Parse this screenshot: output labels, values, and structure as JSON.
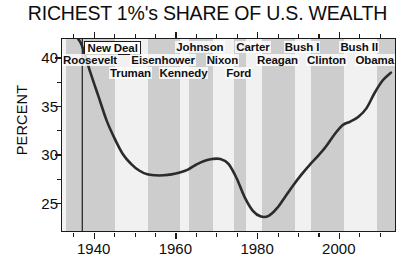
{
  "chart_data": {
    "type": "line",
    "title": "RICHEST 1%'s SHARE OF U.S. WEALTH",
    "xlabel": "",
    "ylabel": "PERCENT",
    "xlim": [
      1932,
      2014
    ],
    "ylim": [
      22.0,
      42.0
    ],
    "grid": false,
    "legend": "none",
    "x_ticks": [
      1940,
      1960,
      1980,
      2000
    ],
    "x_tick_labels": [
      "1940",
      "1960",
      "1980",
      "2000"
    ],
    "x_minor_tick_step": 5,
    "y_ticks": [
      25,
      30,
      35,
      40
    ],
    "y_tick_labels": [
      "25",
      "30",
      "35",
      "40"
    ],
    "series": [
      {
        "name": "Richest 1% share of U.S. wealth",
        "color": "#2b2b2b",
        "x": [
          1932,
          1934,
          1936,
          1937,
          1939,
          1941,
          1943,
          1945,
          1947,
          1949,
          1951,
          1953,
          1955,
          1957,
          1959,
          1961,
          1963,
          1965,
          1967,
          1969,
          1971,
          1973,
          1975,
          1977,
          1979,
          1981,
          1983,
          1985,
          1987,
          1989,
          1991,
          1993,
          1995,
          1997,
          1999,
          2001,
          2003,
          2005,
          2007,
          2009,
          2011,
          2013
        ],
        "y": [
          44.0,
          43.2,
          42.0,
          41.2,
          38.5,
          36.0,
          33.5,
          31.6,
          30.0,
          29.0,
          28.3,
          27.9,
          27.8,
          27.8,
          27.9,
          28.1,
          28.4,
          28.9,
          29.3,
          29.5,
          29.5,
          29.0,
          27.5,
          25.5,
          24.1,
          23.5,
          23.6,
          24.4,
          25.6,
          26.8,
          27.9,
          28.9,
          29.8,
          30.8,
          32.0,
          33.0,
          33.4,
          33.9,
          34.8,
          36.4,
          37.7,
          38.5
        ]
      }
    ],
    "annotations": {
      "event_line": {
        "label": "New Deal",
        "year": 1937,
        "boxed": true
      },
      "presidents": [
        {
          "label": "Roosevelt",
          "start": 1933,
          "end": 1945,
          "row": 1,
          "shaded": true
        },
        {
          "label": "Truman",
          "start": 1945,
          "end": 1953,
          "row": 2,
          "shaded": false
        },
        {
          "label": "Eisenhower",
          "start": 1953,
          "end": 1961,
          "row": 1,
          "shaded": true
        },
        {
          "label": "Kennedy",
          "start": 1961,
          "end": 1963,
          "row": 2,
          "shaded": false
        },
        {
          "label": "Johnson",
          "start": 1963,
          "end": 1969,
          "row": 0,
          "shaded": true
        },
        {
          "label": "Nixon",
          "start": 1969,
          "end": 1974,
          "row": 1,
          "shaded": false
        },
        {
          "label": "Ford",
          "start": 1974,
          "end": 1977,
          "row": 2,
          "shaded": true
        },
        {
          "label": "Carter",
          "start": 1977,
          "end": 1981,
          "row": 0,
          "shaded": false
        },
        {
          "label": "Reagan",
          "start": 1981,
          "end": 1989,
          "row": 1,
          "shaded": true
        },
        {
          "label": "Bush I",
          "start": 1989,
          "end": 1993,
          "row": 0,
          "shaded": false
        },
        {
          "label": "Clinton",
          "start": 1993,
          "end": 2001,
          "row": 1,
          "shaded": true
        },
        {
          "label": "Bush II",
          "start": 2001,
          "end": 2009,
          "row": 0,
          "shaded": false
        },
        {
          "label": "Obama",
          "start": 2009,
          "end": 2014,
          "row": 1,
          "shaded": true
        }
      ]
    },
    "colors": {
      "line": "#2b2b2b",
      "band_shaded": "#cdcdcd",
      "band_light": "#f1f1f1",
      "plot_background": "#f3f3f3",
      "axis": "#1a1a1a",
      "text": "#0d0d0d"
    }
  }
}
